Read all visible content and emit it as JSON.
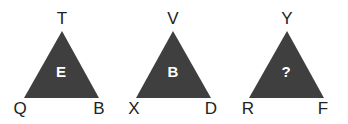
{
  "puzzle": {
    "triangles": [
      {
        "top": "T",
        "left": "Q",
        "right": "B",
        "center": "E"
      },
      {
        "top": "V",
        "left": "X",
        "right": "D",
        "center": "B"
      },
      {
        "top": "Y",
        "left": "R",
        "right": "F",
        "center": "?"
      }
    ],
    "fill_color": "#3f3f3f"
  }
}
